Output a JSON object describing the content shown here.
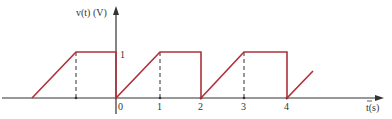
{
  "diagram": {
    "type": "waveform",
    "y_axis_label": "v(t) (V)",
    "x_axis_label": "t(s)",
    "level_label": "1",
    "x_ticks": [
      "0",
      "1",
      "2",
      "3",
      "4"
    ],
    "colors": {
      "waveform": "#b0303a",
      "axis": "#333333",
      "dashed": "#333333"
    },
    "segments": [
      {
        "kind": "zero",
        "t_start": -2.6,
        "t_end": -2,
        "v": 0
      },
      {
        "kind": "ramp",
        "t_start": -2,
        "t_end": -1,
        "v_start": 0,
        "v_end": 1
      },
      {
        "kind": "flat",
        "t_start": -1,
        "t_end": 0,
        "v": 1
      },
      {
        "kind": "drop",
        "t": 0,
        "v_start": 1,
        "v_end": 0
      },
      {
        "kind": "ramp",
        "t_start": 0,
        "t_end": 1,
        "v_start": 0,
        "v_end": 1
      },
      {
        "kind": "flat",
        "t_start": 1,
        "t_end": 2,
        "v": 1
      },
      {
        "kind": "drop",
        "t": 2,
        "v_start": 1,
        "v_end": 0
      },
      {
        "kind": "ramp",
        "t_start": 2,
        "t_end": 3,
        "v_start": 0,
        "v_end": 1
      },
      {
        "kind": "flat",
        "t_start": 3,
        "t_end": 4,
        "v": 1
      },
      {
        "kind": "drop",
        "t": 4,
        "v_start": 1,
        "v_end": 0
      },
      {
        "kind": "ramp",
        "t_start": 4,
        "t_end": 4.6,
        "v_start": 0,
        "v_end": 0.6
      }
    ],
    "dashed_markers_t": [
      -1,
      1,
      3
    ]
  }
}
